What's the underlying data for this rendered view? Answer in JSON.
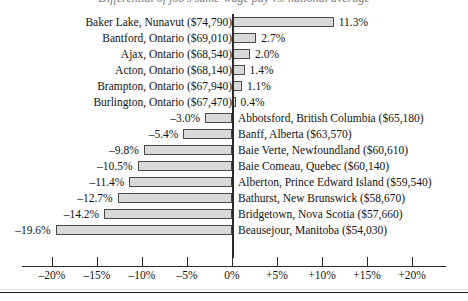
{
  "figure": {
    "title_clipped": "Differential of job's same-wage pay vs. national average",
    "axis_color": "#2b2b2b",
    "bar_fill": "#d9d9d9",
    "bar_border": "#4a4a4a"
  },
  "chart_data": {
    "type": "bar",
    "orientation": "horizontal",
    "title": "Differential of job's same-wage pay vs. national average",
    "xlabel": "",
    "ylabel": "",
    "xlim": [
      -20,
      20
    ],
    "grid": false,
    "legend": null,
    "tick_labels": [
      "–20%",
      "–15%",
      "–10%",
      "–5%",
      "0%",
      "+5%",
      "+10%",
      "+15%",
      "+20%"
    ],
    "tick_values": [
      -20,
      -15,
      -10,
      -5,
      0,
      5,
      10,
      15,
      20
    ],
    "categories": [
      "Baker Lake, Nunavut ($74,790)",
      "Bantford, Ontario ($69,010)",
      "Ajax, Ontario ($68,540)",
      "Acton, Ontario ($68,140)",
      "Brampton, Ontario ($67,940)",
      "Burlington, Ontario ($67,470)",
      "Abbotsford, British Columbia ($65,180)",
      "Banff, Alberta ($63,570)",
      "Baie Verte, Newfoundland ($60,610)",
      "Baie Comeau, Quebec ($60,140)",
      "Alberton, Prince Edward Island ($59,540)",
      "Bathurst, New Brunswick ($58,670)",
      "Bridgetown, Nova Scotia ($57,660)",
      "Beausejour, Manitoba ($54,030)"
    ],
    "values": [
      11.3,
      2.7,
      2.0,
      1.4,
      1.1,
      0.4,
      -3.0,
      -5.4,
      -9.8,
      -10.5,
      -11.4,
      -12.7,
      -14.2,
      -19.6
    ],
    "value_labels": [
      "11.3%",
      "2.7%",
      "2.0%",
      "1.4%",
      "1.1%",
      "0.4%",
      "–3.0%",
      "–5.4%",
      "–9.8%",
      "–10.5%",
      "–11.4%",
      "–12.7%",
      "–14.2%",
      "–19.6%"
    ]
  }
}
